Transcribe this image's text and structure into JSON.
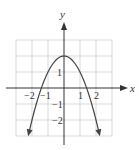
{
  "chart_data": {
    "type": "line",
    "title": "",
    "xlabel": "x",
    "ylabel": "y",
    "xlim": [
      -2.5,
      2.5
    ],
    "ylim": [
      -2.7,
      2.7
    ],
    "grid": true,
    "x_ticks": [
      "-2",
      "-1",
      "1",
      "2"
    ],
    "y_ticks": [
      "1",
      "-1",
      "-2"
    ],
    "series": [
      {
        "name": "parabola",
        "equation": "y = 2 - x^2",
        "x": [
          -2.2,
          -2,
          -1.5,
          -1,
          -0.5,
          0,
          0.5,
          1,
          1.5,
          2,
          2.2
        ],
        "y": [
          -2.84,
          -2,
          -0.25,
          1,
          1.75,
          2,
          1.75,
          1,
          -0.25,
          -2,
          -2.84
        ]
      }
    ],
    "annotations": [
      "arrowheads at both ends of curve",
      "arrowheads on positive x and y axes"
    ]
  },
  "labels": {
    "x_axis": "x",
    "y_axis": "y",
    "xt_m2": "−2",
    "xt_m1": "−1",
    "xt_1": "1",
    "xt_2": "2",
    "yt_1": "1",
    "yt_m1": "−1",
    "yt_m2": "−2"
  }
}
